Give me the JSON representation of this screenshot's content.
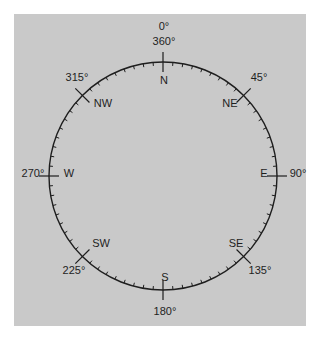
{
  "diagram": {
    "type": "compass-rose",
    "panel_color": "#c9c9c9",
    "line_color": "#1e1e1e",
    "center": [
      163,
      176
    ],
    "radius": 114,
    "tick_interval_deg": 5,
    "directions": [
      {
        "abbr": "N",
        "degrees_label": "0°",
        "degrees_label_2": "360°",
        "angle": 0
      },
      {
        "abbr": "NE",
        "degrees_label": "45°",
        "angle": 45
      },
      {
        "abbr": "E",
        "degrees_label": "90°",
        "angle": 90
      },
      {
        "abbr": "SE",
        "degrees_label": "135°",
        "angle": 135
      },
      {
        "abbr": "S",
        "degrees_label": "180°",
        "angle": 180
      },
      {
        "abbr": "SW",
        "degrees_label": "225°",
        "angle": 225
      },
      {
        "abbr": "W",
        "degrees_label": "270°",
        "angle": 270
      },
      {
        "abbr": "NW",
        "degrees_label": "315°",
        "angle": 315
      }
    ]
  }
}
